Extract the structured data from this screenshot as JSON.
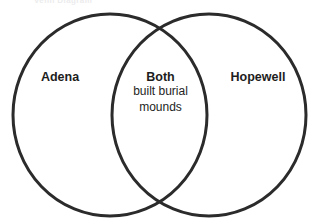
{
  "canvas": {
    "width": 317,
    "height": 224,
    "background": "#ffffff"
  },
  "top_fragment": {
    "text": "Venn Diagram",
    "note": "faint cropped text at top edge, barely legible",
    "color": "#ececed"
  },
  "diagram": {
    "type": "venn",
    "stroke_color": "#2b2b2b",
    "stroke_width": 3,
    "fill": "none",
    "sets": [
      {
        "id": "left",
        "title": "Adena",
        "body": "",
        "cx": 110,
        "cy": 115,
        "rx": 97,
        "ry": 101
      },
      {
        "id": "right",
        "title": "Hopewell",
        "body": "",
        "cx": 209,
        "cy": 115,
        "rx": 97,
        "ry": 101
      }
    ],
    "intersection": {
      "id": "both",
      "title": "Both",
      "body_lines": [
        "built burial",
        "mounds"
      ]
    }
  }
}
